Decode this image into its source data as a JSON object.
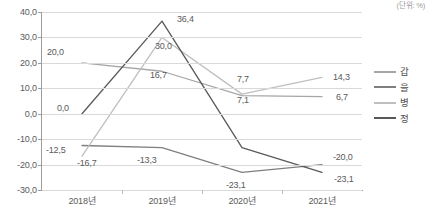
{
  "unit_note": "(단위: %)",
  "legend": {
    "position": "right",
    "items": [
      {
        "label": "갑",
        "color": "#a6a6a6"
      },
      {
        "label": "을",
        "color": "#7f7f7f"
      },
      {
        "label": "병",
        "color": "#bfbfbf"
      },
      {
        "label": "정",
        "color": "#595959"
      }
    ]
  },
  "axis": {
    "y_ticks": [
      "40,0",
      "30,0",
      "20,0",
      "10,0",
      "0,0",
      "-10,0",
      "-20,0",
      "-30,0"
    ],
    "x_ticks": [
      "2018년",
      "2019년",
      "2020년",
      "2021년"
    ]
  },
  "point_labels": [
    {
      "text": "20,0",
      "x": 47,
      "y": 47
    },
    {
      "text": "0,0",
      "x": 57,
      "y": 103
    },
    {
      "text": "-12,5",
      "x": 46,
      "y": 145
    },
    {
      "text": "-16,7",
      "x": 77,
      "y": 158
    },
    {
      "text": "36,4",
      "x": 177,
      "y": 14
    },
    {
      "text": "30,0",
      "x": 155,
      "y": 41
    },
    {
      "text": "16,7",
      "x": 150,
      "y": 70
    },
    {
      "text": "-13,3",
      "x": 137,
      "y": 155
    },
    {
      "text": "7,7",
      "x": 237,
      "y": 74
    },
    {
      "text": "7,1",
      "x": 237,
      "y": 95
    },
    {
      "text": "-23,1",
      "x": 226,
      "y": 180
    },
    {
      "text": "14,3",
      "x": 333,
      "y": 72
    },
    {
      "text": "6,7",
      "x": 336,
      "y": 92
    },
    {
      "text": "-20,0",
      "x": 333,
      "y": 152
    },
    {
      "text": "-23,1",
      "x": 334,
      "y": 174
    }
  ],
  "chart_data": {
    "type": "line",
    "title": "",
    "xlabel": "",
    "ylabel": "",
    "unit": "(단위: %)",
    "categories": [
      "2018년",
      "2019년",
      "2020년",
      "2021년"
    ],
    "ylim": [
      -30.0,
      40.0
    ],
    "ytick_step": 10.0,
    "grid": true,
    "legend_position": "right",
    "series": [
      {
        "name": "갑",
        "color": "#a6a6a6",
        "values": [
          20.0,
          16.7,
          7.1,
          6.7
        ]
      },
      {
        "name": "을",
        "color": "#7f7f7f",
        "values": [
          -12.5,
          -13.3,
          -23.1,
          -20.0
        ]
      },
      {
        "name": "병",
        "color": "#bfbfbf",
        "values": [
          -16.7,
          30.0,
          7.7,
          14.3
        ]
      },
      {
        "name": "정",
        "color": "#595959",
        "values": [
          0.0,
          36.4,
          -13.3,
          -23.1
        ]
      }
    ]
  }
}
